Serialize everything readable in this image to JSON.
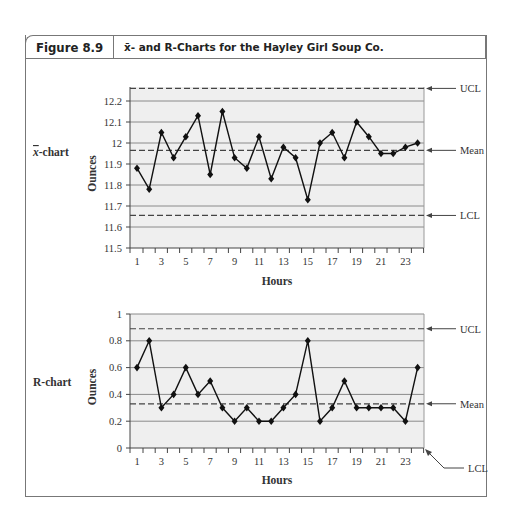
{
  "figure": {
    "number": "Figure 8.9",
    "title": "x̄- and R-Charts for the Hayley Girl Soup Co."
  },
  "chart_data": [
    {
      "type": "line",
      "name": "x̄-chart",
      "row_label": "x̄-chart",
      "xlabel": "Hours",
      "ylabel": "Ounces",
      "ylim": [
        11.5,
        12.25
      ],
      "yticks": [
        "11.5",
        "11.6",
        "11.7",
        "11.8",
        "11.9",
        "12",
        "12.1",
        "12.2"
      ],
      "xticks": [
        "1",
        "3",
        "5",
        "7",
        "9",
        "11",
        "13",
        "15",
        "17",
        "19",
        "21",
        "23"
      ],
      "grid": true,
      "x": [
        1,
        2,
        3,
        4,
        5,
        6,
        7,
        8,
        9,
        10,
        11,
        12,
        13,
        14,
        15,
        16,
        17,
        18,
        19,
        20,
        21,
        22,
        23,
        24
      ],
      "values": [
        11.88,
        11.78,
        12.05,
        11.93,
        12.03,
        12.13,
        11.85,
        12.15,
        11.93,
        11.88,
        12.03,
        11.83,
        11.98,
        11.93,
        11.73,
        12.0,
        12.05,
        11.93,
        12.1,
        12.03,
        11.95,
        11.95,
        11.98,
        12.0
      ],
      "control_lines": [
        {
          "label": "UCL",
          "value": 12.26
        },
        {
          "label": "Mean",
          "value": 11.965
        },
        {
          "label": "LCL",
          "value": 11.655
        }
      ]
    },
    {
      "type": "line",
      "name": "R-chart",
      "row_label": "R-chart",
      "xlabel": "Hours",
      "ylabel": "Ounces",
      "ylim": [
        0,
        1
      ],
      "yticks": [
        "0",
        "0.2",
        "0.4",
        "0.6",
        "0.8",
        "1"
      ],
      "xticks": [
        "1",
        "3",
        "5",
        "7",
        "9",
        "11",
        "13",
        "15",
        "17",
        "19",
        "21",
        "23"
      ],
      "grid": true,
      "x": [
        1,
        2,
        3,
        4,
        5,
        6,
        7,
        8,
        9,
        10,
        11,
        12,
        13,
        14,
        15,
        16,
        17,
        18,
        19,
        20,
        21,
        22,
        23,
        24
      ],
      "values": [
        0.6,
        0.8,
        0.3,
        0.4,
        0.6,
        0.4,
        0.5,
        0.3,
        0.2,
        0.3,
        0.2,
        0.2,
        0.3,
        0.4,
        0.8,
        0.2,
        0.3,
        0.5,
        0.3,
        0.3,
        0.3,
        0.3,
        0.2,
        0.6
      ],
      "control_lines": [
        {
          "label": "UCL",
          "value": 0.89
        },
        {
          "label": "Mean",
          "value": 0.33
        },
        {
          "label": "LCL",
          "value": 0
        }
      ]
    }
  ]
}
